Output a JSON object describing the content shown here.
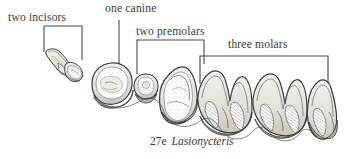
{
  "figure": {
    "caption_number": "27e",
    "caption_species": "Lasionycteris",
    "background_color": "#ffffff",
    "ink_color": "#3a3a3a"
  },
  "labels": {
    "incisors": "two incisors",
    "canine": "one canine",
    "premolars": "two premolars",
    "molars": "three molars"
  },
  "annotations": {
    "incisors_bracket": "bracket-incisors",
    "canine_leader": "leader-line-canine",
    "premolars_bracket": "bracket-premolars",
    "molars_bracket": "bracket-molars"
  },
  "teeth": [
    {
      "name": "incisor-1",
      "group": "incisors"
    },
    {
      "name": "incisor-2",
      "group": "incisors"
    },
    {
      "name": "canine",
      "group": "canine"
    },
    {
      "name": "premolar-1",
      "group": "premolars"
    },
    {
      "name": "premolar-2",
      "group": "premolars"
    },
    {
      "name": "molar-1",
      "group": "molars"
    },
    {
      "name": "molar-2",
      "group": "molars"
    },
    {
      "name": "molar-3",
      "group": "molars"
    }
  ]
}
